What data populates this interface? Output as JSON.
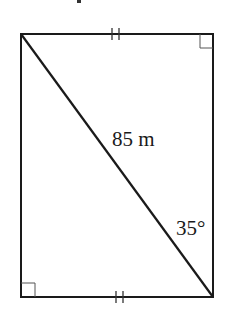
{
  "diagram": {
    "type": "rectangle-with-diagonal",
    "rectangle": {
      "x1": 21,
      "y1": 34,
      "x2": 213,
      "y2": 297,
      "stroke": "#1a1a1a"
    },
    "diagonal": {
      "from": "top-left",
      "to": "bottom-right",
      "length_label": "85 m"
    },
    "angle_label": "35°",
    "right_angle_marks": [
      "top-right",
      "bottom-left"
    ],
    "equal_side_marks": {
      "top": "||",
      "bottom": "||"
    },
    "top_fragment": "·"
  }
}
